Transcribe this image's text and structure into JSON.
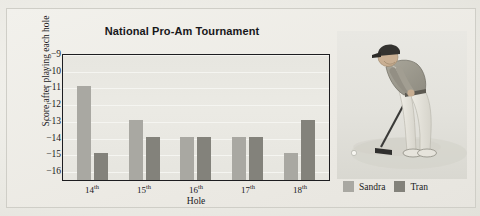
{
  "chart_data": {
    "type": "bar",
    "title": "National Pro-Am Tournament",
    "xlabel": "Hole",
    "ylabel": "Score after playing each hole",
    "categories": [
      "14th",
      "15th",
      "16th",
      "17th",
      "18th"
    ],
    "category_numbers": [
      "14",
      "15",
      "16",
      "17",
      "18"
    ],
    "category_suffix": "th",
    "series": [
      {
        "name": "Sandra",
        "color": "#a9a8a2",
        "values": [
          -11,
          -13,
          -14,
          -14,
          -15
        ]
      },
      {
        "name": "Tran",
        "color": "#83827b",
        "values": [
          -15,
          -14,
          -14,
          -14,
          -13
        ]
      }
    ],
    "ylim": [
      -16.6,
      -9
    ],
    "yticks": [
      -9,
      -10,
      -11,
      -12,
      -13,
      -14,
      -15,
      -16
    ],
    "ytick_labels": [
      "−9",
      "−10",
      "−11",
      "−12",
      "−13",
      "−14",
      "−15",
      "−16"
    ],
    "grid": true,
    "legend_position": "bottom-right"
  },
  "figure": {
    "photo_caption": "golfer-putting-photograph"
  }
}
